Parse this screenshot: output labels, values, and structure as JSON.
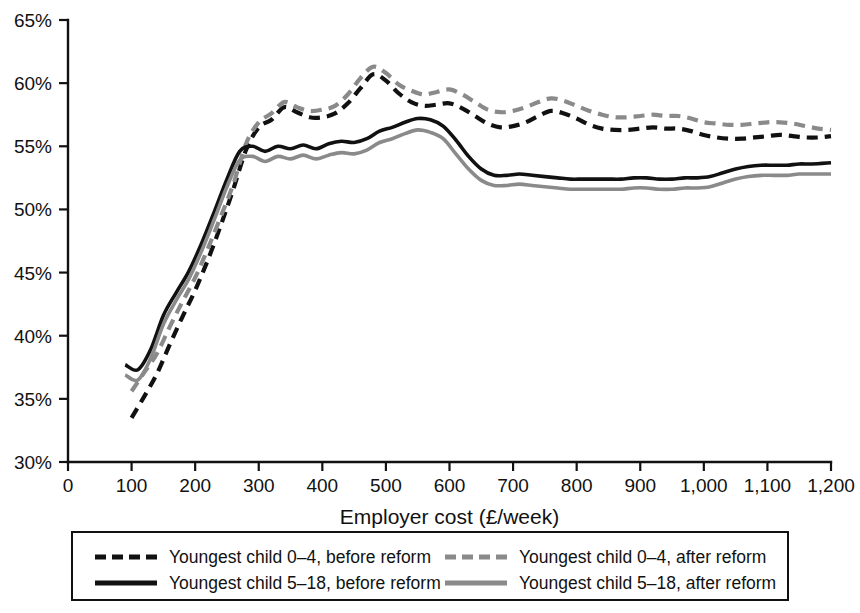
{
  "chart_data": {
    "type": "line",
    "title": "",
    "xlabel": "Employer cost (£/week)",
    "ylabel": "",
    "xlim": [
      0,
      1200
    ],
    "ylim": [
      30,
      65
    ],
    "grid": false,
    "legend_position": "bottom",
    "x_ticks": [
      0,
      100,
      200,
      300,
      400,
      500,
      600,
      700,
      800,
      900,
      1000,
      1100,
      1200
    ],
    "x_tick_labels": [
      "0",
      "100",
      "200",
      "300",
      "400",
      "500",
      "600",
      "700",
      "800",
      "900",
      "1,000",
      "1,100",
      "1,200"
    ],
    "y_ticks": [
      30,
      35,
      40,
      45,
      50,
      55,
      60,
      65
    ],
    "y_tick_labels": [
      "30%",
      "35%",
      "40%",
      "45%",
      "50%",
      "55%",
      "60%",
      "65%"
    ],
    "series": [
      {
        "name": "Youngest child 0–4, before reform",
        "style": "dashed",
        "color": "#111111",
        "x": [
          100,
          120,
          140,
          160,
          180,
          200,
          220,
          240,
          260,
          280,
          300,
          320,
          340,
          360,
          380,
          400,
          420,
          440,
          460,
          480,
          500,
          520,
          540,
          560,
          580,
          600,
          620,
          640,
          660,
          680,
          700,
          720,
          740,
          760,
          780,
          800,
          820,
          840,
          860,
          880,
          900,
          920,
          940,
          960,
          980,
          1000,
          1020,
          1040,
          1060,
          1080,
          1100,
          1120,
          1140,
          1160,
          1180,
          1200
        ],
        "y": [
          33.5,
          35.2,
          37.0,
          39.3,
          41.5,
          43.6,
          46.0,
          48.7,
          51.6,
          54.7,
          56.5,
          57.1,
          58.1,
          57.7,
          57.3,
          57.3,
          57.6,
          58.4,
          59.6,
          60.7,
          60.2,
          59.2,
          58.5,
          58.2,
          58.3,
          58.4,
          58.0,
          57.4,
          56.8,
          56.5,
          56.6,
          56.9,
          57.4,
          57.8,
          57.6,
          57.2,
          56.7,
          56.4,
          56.3,
          56.3,
          56.4,
          56.5,
          56.4,
          56.4,
          56.2,
          55.9,
          55.7,
          55.6,
          55.6,
          55.7,
          55.8,
          55.9,
          55.8,
          55.7,
          55.7,
          55.8
        ]
      },
      {
        "name": "Youngest child 0–4, after reform",
        "style": "dashed",
        "color": "#8a8a8a",
        "x": [
          100,
          120,
          140,
          160,
          180,
          200,
          220,
          240,
          260,
          280,
          300,
          320,
          340,
          360,
          380,
          400,
          420,
          440,
          460,
          480,
          500,
          520,
          540,
          560,
          580,
          600,
          620,
          640,
          660,
          680,
          700,
          720,
          740,
          760,
          780,
          800,
          820,
          840,
          860,
          880,
          900,
          920,
          940,
          960,
          980,
          1000,
          1020,
          1040,
          1060,
          1080,
          1100,
          1120,
          1140,
          1160,
          1180,
          1200
        ],
        "y": [
          35.6,
          37.1,
          38.6,
          40.7,
          42.7,
          44.6,
          46.9,
          49.4,
          52.0,
          55.2,
          56.9,
          57.6,
          58.5,
          58.1,
          57.8,
          57.9,
          58.2,
          59.1,
          60.4,
          61.3,
          60.8,
          59.9,
          59.4,
          59.1,
          59.3,
          59.5,
          59.1,
          58.5,
          57.9,
          57.7,
          57.8,
          58.1,
          58.5,
          58.8,
          58.6,
          58.2,
          57.8,
          57.5,
          57.3,
          57.3,
          57.4,
          57.5,
          57.4,
          57.4,
          57.2,
          56.9,
          56.8,
          56.7,
          56.7,
          56.8,
          56.9,
          56.9,
          56.8,
          56.6,
          56.4,
          56.3
        ]
      },
      {
        "name": "Youngest child 5–18, before reform",
        "style": "solid",
        "color": "#111111",
        "x": [
          90,
          110,
          130,
          150,
          170,
          190,
          210,
          230,
          250,
          270,
          290,
          310,
          330,
          350,
          370,
          390,
          410,
          430,
          450,
          470,
          490,
          510,
          530,
          550,
          570,
          590,
          610,
          630,
          650,
          670,
          690,
          710,
          730,
          750,
          770,
          790,
          810,
          830,
          850,
          870,
          890,
          910,
          930,
          950,
          970,
          990,
          1010,
          1030,
          1050,
          1070,
          1090,
          1110,
          1130,
          1150,
          1170,
          1200
        ],
        "y": [
          37.7,
          37.3,
          38.9,
          41.6,
          43.4,
          45.1,
          47.3,
          49.8,
          52.4,
          54.6,
          55.0,
          54.6,
          55.0,
          54.8,
          55.1,
          54.8,
          55.2,
          55.4,
          55.3,
          55.6,
          56.2,
          56.5,
          56.9,
          57.2,
          57.1,
          56.6,
          55.5,
          54.2,
          53.2,
          52.7,
          52.7,
          52.8,
          52.7,
          52.6,
          52.5,
          52.4,
          52.4,
          52.4,
          52.4,
          52.4,
          52.5,
          52.5,
          52.4,
          52.4,
          52.5,
          52.5,
          52.6,
          52.9,
          53.2,
          53.4,
          53.5,
          53.5,
          53.5,
          53.6,
          53.6,
          53.7
        ]
      },
      {
        "name": "Youngest child 5–18, after reform",
        "style": "solid",
        "color": "#8a8a8a",
        "x": [
          90,
          110,
          130,
          150,
          170,
          190,
          210,
          230,
          250,
          270,
          290,
          310,
          330,
          350,
          370,
          390,
          410,
          430,
          450,
          470,
          490,
          510,
          530,
          550,
          570,
          590,
          610,
          630,
          650,
          670,
          690,
          710,
          730,
          750,
          770,
          790,
          810,
          830,
          850,
          870,
          890,
          910,
          930,
          950,
          970,
          990,
          1010,
          1030,
          1050,
          1070,
          1090,
          1110,
          1130,
          1150,
          1170,
          1200
        ],
        "y": [
          36.9,
          36.5,
          38.2,
          40.9,
          42.8,
          44.5,
          46.7,
          49.2,
          51.8,
          53.9,
          54.2,
          53.8,
          54.2,
          54.0,
          54.3,
          54.0,
          54.3,
          54.5,
          54.4,
          54.7,
          55.3,
          55.6,
          56.0,
          56.3,
          56.1,
          55.6,
          54.4,
          53.2,
          52.3,
          51.9,
          51.9,
          52.0,
          51.9,
          51.8,
          51.7,
          51.6,
          51.6,
          51.6,
          51.6,
          51.6,
          51.7,
          51.7,
          51.6,
          51.6,
          51.7,
          51.7,
          51.8,
          52.1,
          52.4,
          52.6,
          52.7,
          52.7,
          52.7,
          52.8,
          52.8,
          52.8
        ]
      }
    ]
  },
  "legend": {
    "entries": [
      {
        "label": "Youngest child 0–4, before reform",
        "style": "dashed",
        "color": "#111111"
      },
      {
        "label": "Youngest child 0–4, after reform",
        "style": "dashed",
        "color": "#8a8a8a"
      },
      {
        "label": "Youngest child 5–18, before reform",
        "style": "solid",
        "color": "#111111"
      },
      {
        "label": "Youngest child 5–18, after reform",
        "style": "solid",
        "color": "#8a8a8a"
      }
    ]
  },
  "colors": {
    "before_reform": "#111111",
    "after_reform": "#8a8a8a",
    "axis": "#111111",
    "background": "#ffffff"
  }
}
